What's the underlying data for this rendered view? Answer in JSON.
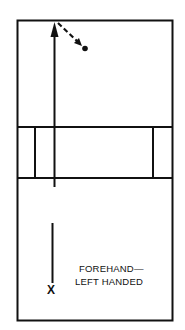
{
  "diagram": {
    "type": "court-shot-diagram",
    "caption": {
      "line1": "FOREHAND—",
      "line2": "LEFT HANDED"
    },
    "player_marker": "X",
    "colors": {
      "line": "#111111",
      "background": "#ffffff"
    },
    "court": {
      "outer": {
        "x1": 17,
        "y1": 20,
        "x2": 173,
        "y2": 321
      },
      "net_band": {
        "top": 127,
        "bottom": 178
      },
      "inner_verticals_x": [
        35,
        153
      ]
    },
    "shot_path": {
      "main_arrow": {
        "from": [
          54,
          187
        ],
        "to": [
          54,
          22
        ]
      },
      "deflection_dashed": {
        "from": [
          57,
          22
        ],
        "to": [
          81,
          45
        ]
      },
      "ball_dot": [
        85,
        48
      ],
      "approach_line": {
        "from": [
          52,
          223
        ],
        "to": [
          52,
          283
        ]
      }
    }
  }
}
